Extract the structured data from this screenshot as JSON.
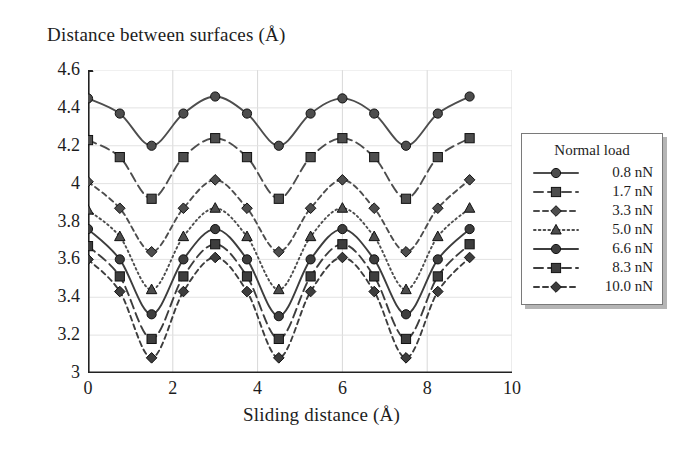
{
  "figure": {
    "ytitle": "Distance between surfaces (Å)",
    "xtitle": "Sliding distance (Å)"
  },
  "legend": {
    "title": "Normal load",
    "entries": [
      {
        "label": "0.8 nN",
        "marker": "circle",
        "dash": "solid"
      },
      {
        "label": "1.7 nN",
        "marker": "square",
        "dash": "dashed"
      },
      {
        "label": "3.3 nN",
        "marker": "diamond",
        "dash": "dashed-short"
      },
      {
        "label": "5.0 nN",
        "marker": "triangle",
        "dash": "dotted"
      },
      {
        "label": "6.6 nN",
        "marker": "circle",
        "dash": "solid"
      },
      {
        "label": "8.3 nN",
        "marker": "square",
        "dash": "dashed"
      },
      {
        "label": "10.0 nN",
        "marker": "diamond",
        "dash": "dashed-short"
      }
    ]
  },
  "chart_data": {
    "type": "line",
    "title": "",
    "xlabel": "Sliding distance (Å)",
    "ylabel": "Distance between surfaces (Å)",
    "xlim": [
      0,
      10
    ],
    "ylim": [
      3,
      4.6
    ],
    "xticks": [
      0,
      2,
      4,
      6,
      8,
      10
    ],
    "yticks": [
      3,
      3.2,
      3.4,
      3.6,
      3.8,
      4,
      4.2,
      4.4,
      4.6
    ],
    "grid": true,
    "legend_position": "right-outside",
    "legend_title": "Normal load",
    "x": [
      0,
      0.75,
      1.5,
      2.25,
      3,
      3.75,
      4.5,
      5.25,
      6,
      6.75,
      7.5,
      8.25,
      9
    ],
    "series": [
      {
        "name": "0.8 nN",
        "marker": "circle",
        "dash": "solid",
        "color": "#4d4d4d",
        "values": [
          4.45,
          4.37,
          4.2,
          4.37,
          4.46,
          4.37,
          4.2,
          4.37,
          4.45,
          4.37,
          4.2,
          4.37,
          4.46
        ]
      },
      {
        "name": "1.7 nN",
        "marker": "square",
        "dash": "dashed",
        "color": "#4d4d4d",
        "values": [
          4.23,
          4.14,
          3.92,
          4.14,
          4.24,
          4.14,
          3.92,
          4.14,
          4.24,
          4.14,
          3.92,
          4.14,
          4.24
        ]
      },
      {
        "name": "3.3 nN",
        "marker": "diamond",
        "dash": "dashed-short",
        "color": "#4d4d4d",
        "values": [
          4.01,
          3.87,
          3.64,
          3.87,
          4.02,
          3.87,
          3.64,
          3.87,
          4.02,
          3.87,
          3.64,
          3.87,
          4.02
        ]
      },
      {
        "name": "5.0 nN",
        "marker": "triangle",
        "dash": "dotted",
        "color": "#4d4d4d",
        "values": [
          3.86,
          3.72,
          3.44,
          3.72,
          3.87,
          3.72,
          3.44,
          3.72,
          3.87,
          3.72,
          3.44,
          3.72,
          3.87
        ]
      },
      {
        "name": "6.6 nN",
        "marker": "circle",
        "dash": "solid",
        "color": "#3d3d3d",
        "values": [
          3.76,
          3.6,
          3.31,
          3.6,
          3.76,
          3.6,
          3.3,
          3.6,
          3.76,
          3.6,
          3.31,
          3.6,
          3.76
        ]
      },
      {
        "name": "8.3 nN",
        "marker": "square",
        "dash": "dashed",
        "color": "#3d3d3d",
        "values": [
          3.67,
          3.51,
          3.18,
          3.51,
          3.68,
          3.51,
          3.18,
          3.51,
          3.68,
          3.51,
          3.18,
          3.51,
          3.68
        ]
      },
      {
        "name": "10.0 nN",
        "marker": "diamond",
        "dash": "dashed-short",
        "color": "#3d3d3d",
        "values": [
          3.6,
          3.43,
          3.08,
          3.43,
          3.61,
          3.43,
          3.08,
          3.43,
          3.61,
          3.43,
          3.08,
          3.43,
          3.61
        ]
      }
    ]
  }
}
